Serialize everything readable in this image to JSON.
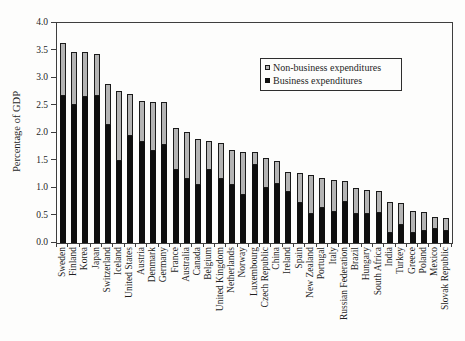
{
  "chart_data": {
    "type": "bar",
    "stacked": true,
    "title": "",
    "xlabel": "",
    "ylabel": "Percentage of GDP",
    "ylim": [
      0.0,
      4.0
    ],
    "ytick_step": 0.5,
    "yticks": [
      "0.0",
      "0.5",
      "1.0",
      "1.5",
      "2.0",
      "2.5",
      "3.0",
      "3.5",
      "4.0"
    ],
    "grid": "off",
    "legend_position": "top-right-inside",
    "categories": [
      "Sweden",
      "Finland",
      "Korea",
      "Japan",
      "Switzerland",
      "Iceland",
      "United States",
      "Austria",
      "Denmark",
      "Germany",
      "France",
      "Australia",
      "Canada",
      "Belgium",
      "United Kingdom",
      "Netherlands",
      "Norway",
      "Luxembourg",
      "Czech Republic",
      "China",
      "Ireland",
      "Spain",
      "New Zealand",
      "Portugal",
      "Italy",
      "Russian Federation",
      "Brazil",
      "Hungary",
      "South Africa",
      "India",
      "Turkey",
      "Greece",
      "Poland",
      "Mexico",
      "Slovak Republic"
    ],
    "series": [
      {
        "name": "Business expenditures",
        "color": "#0f0f0f",
        "values": [
          2.68,
          2.51,
          2.65,
          2.68,
          2.15,
          1.5,
          1.95,
          1.83,
          1.67,
          1.79,
          1.32,
          1.17,
          1.06,
          1.32,
          1.16,
          1.05,
          0.87,
          1.42,
          1.0,
          1.08,
          0.92,
          0.72,
          0.53,
          0.63,
          0.57,
          0.75,
          0.53,
          0.52,
          0.55,
          0.18,
          0.33,
          0.19,
          0.21,
          0.25,
          0.21
        ]
      },
      {
        "name": "Non-business expenditures",
        "color": "#b4b4b4",
        "values": [
          0.95,
          0.97,
          0.82,
          0.76,
          0.75,
          1.27,
          0.76,
          0.76,
          0.9,
          0.77,
          0.78,
          0.85,
          0.83,
          0.54,
          0.65,
          0.65,
          0.78,
          0.24,
          0.54,
          0.41,
          0.38,
          0.55,
          0.7,
          0.55,
          0.57,
          0.38,
          0.47,
          0.45,
          0.4,
          0.57,
          0.39,
          0.39,
          0.36,
          0.23,
          0.25
        ]
      }
    ]
  },
  "colors": {
    "background": "#fdfdfc",
    "axis": "#3e3e3e",
    "text": "#1f1f1f",
    "bar_business": "#0f0f0f",
    "bar_nonbusiness": "#b4b4b4",
    "bar_outline": "#1a1a1a"
  }
}
